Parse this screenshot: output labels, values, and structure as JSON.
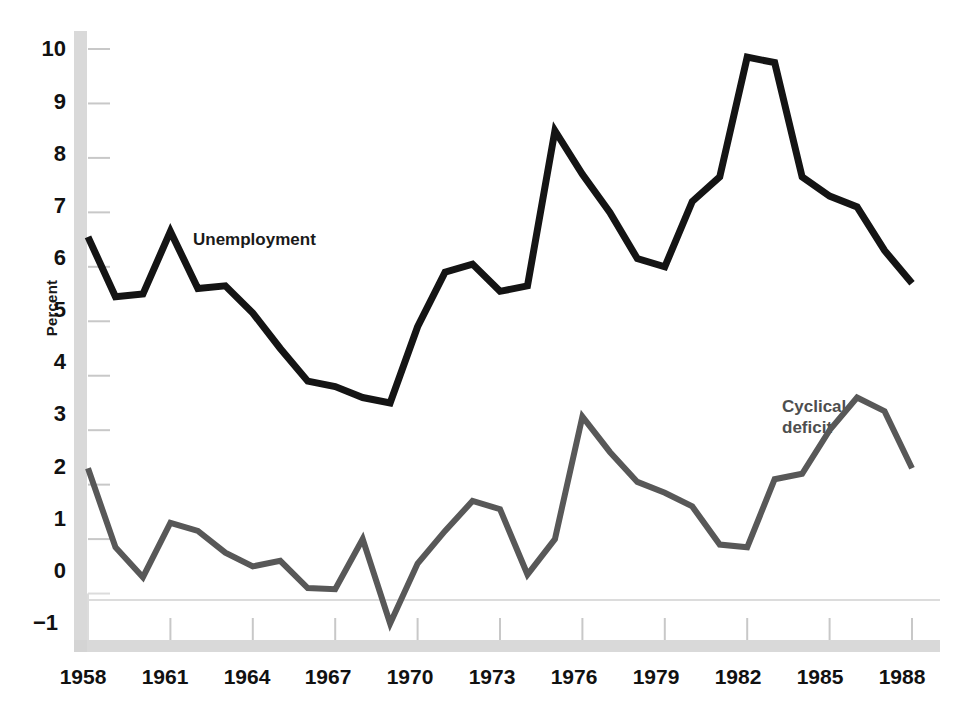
{
  "chart_data": {
    "type": "line",
    "title": "",
    "xlabel": "",
    "ylabel": "Percent",
    "x": [
      1958,
      1959,
      1960,
      1961,
      1962,
      1963,
      1964,
      1965,
      1966,
      1967,
      1968,
      1969,
      1970,
      1971,
      1972,
      1973,
      1974,
      1975,
      1976,
      1977,
      1978,
      1979,
      1980,
      1981,
      1982,
      1983,
      1984,
      1985,
      1986,
      1987,
      1988
    ],
    "xlim": [
      1958,
      1988
    ],
    "ylim": [
      -1,
      10
    ],
    "xticks": [
      1958,
      1961,
      1964,
      1967,
      1970,
      1973,
      1976,
      1979,
      1982,
      1985,
      1988
    ],
    "xticklabels": [
      "1958",
      "1961",
      "1964",
      "1967",
      "1970",
      "1973",
      "1976",
      "1979",
      "1982",
      "1985",
      "1988"
    ],
    "yticks": [
      -1,
      0,
      1,
      2,
      3,
      4,
      5,
      6,
      7,
      8,
      9,
      10
    ],
    "yticklabels": [
      "−1",
      "0",
      "1",
      "2",
      "3",
      "4",
      "5",
      "6",
      "7",
      "8",
      "9",
      "10"
    ],
    "grid": false,
    "legend_position": "inline-annotations",
    "series": [
      {
        "name": "Unemployment",
        "color": "#141414",
        "label_text": "Unemployment",
        "values": [
          6.55,
          5.45,
          5.5,
          6.65,
          5.6,
          5.65,
          5.15,
          4.5,
          3.9,
          3.8,
          3.6,
          3.5,
          4.9,
          5.9,
          6.05,
          5.55,
          5.65,
          8.5,
          7.7,
          7.0,
          6.15,
          6.0,
          7.2,
          7.65,
          9.85,
          9.75,
          7.65,
          7.3,
          7.1,
          6.3,
          5.7
        ]
      },
      {
        "name": "Cyclical deficit",
        "color": "#585858",
        "label_text": "Cyclical\ndeficit",
        "values": [
          2.3,
          0.85,
          0.3,
          1.3,
          1.15,
          0.75,
          0.5,
          0.6,
          0.1,
          0.08,
          1.0,
          -0.55,
          0.55,
          1.15,
          1.7,
          1.55,
          0.35,
          1.0,
          3.25,
          2.6,
          2.05,
          1.85,
          1.6,
          0.9,
          0.85,
          2.1,
          2.2,
          3.0,
          3.6,
          3.35,
          2.3
        ]
      }
    ],
    "cyclical_deficit_values_actual": [
      2.3,
      0.85,
      0.3,
      1.3,
      1.15,
      0.75,
      0.5,
      0.6,
      0.1,
      0.08,
      1.0,
      -0.55,
      0.55,
      1.15,
      1.7,
      1.55,
      0.35,
      1.0,
      3.25,
      2.6,
      2.05,
      1.85,
      1.6,
      0.9,
      0.85,
      1.6,
      2.05,
      2.2,
      3.6,
      3.35,
      2.3
    ]
  },
  "annotations": {
    "unemployment_label": "Unemployment",
    "deficit_label_line1": "Cyclical",
    "deficit_label_line2": "deficit"
  },
  "axis": {
    "y_title": "Percent",
    "y_labels": [
      "10",
      "9",
      "8",
      "7",
      "6",
      "5",
      "4",
      "3",
      "2",
      "1",
      "0",
      "−1"
    ],
    "x_labels": [
      "1958",
      "1961",
      "1964",
      "1967",
      "1970",
      "1973",
      "1976",
      "1979",
      "1982",
      "1985",
      "1988"
    ]
  },
  "colors": {
    "unemployment_line": "#141414",
    "deficit_line": "#585858",
    "axis_band": "#d2d2d2",
    "tick": "#c8c8c8",
    "background": "#ffffff"
  }
}
